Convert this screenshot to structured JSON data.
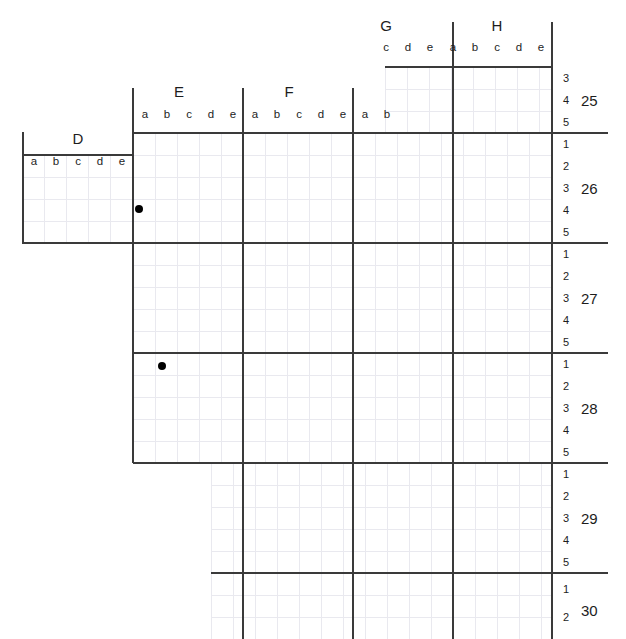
{
  "canvas": {
    "width": 626,
    "height": 639,
    "background": "#ffffff"
  },
  "style": {
    "minor_grid_color": "#e9e9ef",
    "major_line_color": "#3a3a3a",
    "marker_color": "#000000",
    "text_color": "#1d1d1d",
    "cell_size_px": 22
  },
  "column_groups": [
    {
      "label": "D",
      "subs": [
        "a",
        "b",
        "c",
        "d",
        "e"
      ]
    },
    {
      "label": "E",
      "subs": [
        "a",
        "b",
        "c",
        "d",
        "e"
      ]
    },
    {
      "label": "F",
      "subs": [
        "a",
        "b",
        "c",
        "d",
        "e"
      ]
    },
    {
      "label": "G",
      "subs": [
        "a",
        "b",
        "c",
        "d",
        "e"
      ]
    },
    {
      "label": "H",
      "subs": [
        "a",
        "b",
        "c",
        "d",
        "e"
      ]
    }
  ],
  "row_groups": [
    {
      "label": "25",
      "subs": [
        "3",
        "4",
        "5"
      ]
    },
    {
      "label": "26",
      "subs": [
        "1",
        "2",
        "3",
        "4",
        "5"
      ]
    },
    {
      "label": "27",
      "subs": [
        "1",
        "2",
        "3",
        "4",
        "5"
      ]
    },
    {
      "label": "28",
      "subs": [
        "1",
        "2",
        "3",
        "4",
        "5"
      ]
    },
    {
      "label": "29",
      "subs": [
        "1",
        "2",
        "3",
        "4",
        "5"
      ]
    },
    {
      "label": "30",
      "subs": [
        "1",
        "2"
      ]
    }
  ],
  "column_labels_top": {
    "groups": [
      {
        "text": "G",
        "x": 385,
        "y": 23
      },
      {
        "text": "H",
        "x": 496,
        "y": 23
      }
    ],
    "subs": [
      {
        "text": "c",
        "x": 386,
        "y": 46
      },
      {
        "text": "d",
        "x": 408,
        "y": 46
      },
      {
        "text": "e",
        "x": 430,
        "y": 46
      },
      {
        "text": "a",
        "x": 453,
        "y": 46
      },
      {
        "text": "b",
        "x": 475,
        "y": 46
      },
      {
        "text": "c",
        "x": 497,
        "y": 46
      },
      {
        "text": "d",
        "x": 519,
        "y": 46
      },
      {
        "text": "e",
        "x": 541,
        "y": 46
      }
    ]
  },
  "column_labels_mid": {
    "groups": [
      {
        "text": "E",
        "x": 178,
        "y": 89
      },
      {
        "text": "F",
        "x": 288,
        "y": 89
      }
    ],
    "subs": [
      {
        "text": "a",
        "x": 134,
        "y": 114
      },
      {
        "text": "b",
        "x": 156,
        "y": 114
      },
      {
        "text": "c",
        "x": 178,
        "y": 114
      },
      {
        "text": "d",
        "x": 200,
        "y": 114
      },
      {
        "text": "e",
        "x": 222,
        "y": 114
      },
      {
        "text": "a",
        "x": 244,
        "y": 114
      },
      {
        "text": "b",
        "x": 266,
        "y": 114
      },
      {
        "text": "c",
        "x": 288,
        "y": 114
      },
      {
        "text": "d",
        "x": 310,
        "y": 114
      },
      {
        "text": "e",
        "x": 332,
        "y": 114
      },
      {
        "text": "a",
        "x": 354,
        "y": 114
      },
      {
        "text": "b",
        "x": 376,
        "y": 114
      }
    ]
  },
  "column_labels_left": {
    "groups": [
      {
        "text": "D",
        "x": 67,
        "y": 137
      }
    ],
    "subs": [
      {
        "text": "a",
        "x": 23,
        "y": 161
      },
      {
        "text": "b",
        "x": 45,
        "y": 161
      },
      {
        "text": "c",
        "x": 67,
        "y": 161
      },
      {
        "text": "d",
        "x": 89,
        "y": 161
      },
      {
        "text": "e",
        "x": 111,
        "y": 161
      }
    ]
  },
  "row_labels": {
    "groups": [
      {
        "text": "25",
        "x": 588,
        "y": 100
      },
      {
        "text": "26",
        "x": 588,
        "y": 188
      },
      {
        "text": "27",
        "x": 588,
        "y": 298
      },
      {
        "text": "28",
        "x": 588,
        "y": 408
      },
      {
        "text": "29",
        "x": 588,
        "y": 518
      },
      {
        "text": "30",
        "x": 588,
        "y": 617
      }
    ],
    "subs": [
      {
        "text": "3",
        "x": 566,
        "y": 78
      },
      {
        "text": "4",
        "x": 566,
        "y": 100
      },
      {
        "text": "5",
        "x": 566,
        "y": 122
      },
      {
        "text": "1",
        "x": 566,
        "y": 144
      },
      {
        "text": "2",
        "x": 566,
        "y": 166
      },
      {
        "text": "3",
        "x": 566,
        "y": 188
      },
      {
        "text": "4",
        "x": 566,
        "y": 210
      },
      {
        "text": "5",
        "x": 566,
        "y": 232
      },
      {
        "text": "1",
        "x": 566,
        "y": 254
      },
      {
        "text": "2",
        "x": 566,
        "y": 276
      },
      {
        "text": "3",
        "x": 566,
        "y": 298
      },
      {
        "text": "4",
        "x": 566,
        "y": 320
      },
      {
        "text": "5",
        "x": 566,
        "y": 342
      },
      {
        "text": "1",
        "x": 566,
        "y": 364
      },
      {
        "text": "2",
        "x": 566,
        "y": 386
      },
      {
        "text": "3",
        "x": 566,
        "y": 408
      },
      {
        "text": "4",
        "x": 566,
        "y": 430
      },
      {
        "text": "5",
        "x": 566,
        "y": 452
      },
      {
        "text": "1",
        "x": 566,
        "y": 474
      },
      {
        "text": "2",
        "x": 566,
        "y": 496
      },
      {
        "text": "3",
        "x": 566,
        "y": 518
      },
      {
        "text": "4",
        "x": 566,
        "y": 540
      },
      {
        "text": "5",
        "x": 566,
        "y": 562
      },
      {
        "text": "1",
        "x": 566,
        "y": 589
      },
      {
        "text": "2",
        "x": 566,
        "y": 617
      }
    ]
  },
  "markers": [
    {
      "name": "point-E-a-26-4",
      "column": "E",
      "column_sub": "a",
      "row": "26",
      "row_sub": "4",
      "x": 139,
      "y": 209
    },
    {
      "name": "point-E-b-28-1",
      "column": "E",
      "column_sub": "b",
      "row": "28",
      "row_sub": "1",
      "x": 162,
      "y": 366
    }
  ],
  "grid_regions": [
    {
      "name": "region-top-GH",
      "x": 385,
      "y": 67,
      "w": 167,
      "h": 66
    },
    {
      "name": "region-left-D",
      "x": 22,
      "y": 155,
      "w": 111,
      "h": 88
    },
    {
      "name": "region-main-EFG",
      "x": 133,
      "y": 133,
      "w": 419,
      "h": 330
    },
    {
      "name": "region-bottom",
      "x": 211,
      "y": 463,
      "w": 341,
      "h": 176
    }
  ]
}
